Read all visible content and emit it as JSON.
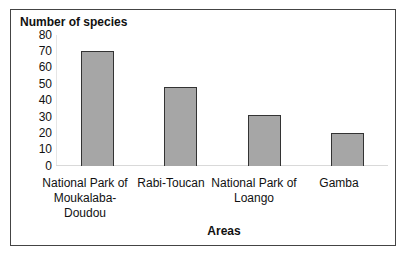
{
  "chart_data": {
    "type": "bar",
    "title": "",
    "ylabel": "Number of species",
    "xlabel": "Areas",
    "categories": [
      "National Park of Moukalaba-Doudou",
      "Rabi-Toucan",
      "National Park of Loango",
      "Gamba"
    ],
    "values": [
      70,
      48,
      31,
      20
    ],
    "ylim": [
      0,
      80
    ],
    "yticks": [
      0,
      10,
      20,
      30,
      40,
      50,
      60,
      70,
      80
    ],
    "grid": false,
    "legend": null,
    "bar_color": "#a6a6a6"
  },
  "labels": {
    "ytitle": "Number of species",
    "xtitle": "Areas",
    "cat0_l1": "National Park of",
    "cat0_l2": "Moukalaba-",
    "cat0_l3": "Doudou",
    "cat1_l1": "Rabi-Toucan",
    "cat2_l1": "National Park of",
    "cat2_l2": "Loango",
    "cat3_l1": "Gamba"
  },
  "ticks": [
    "80",
    "70",
    "60",
    "50",
    "40",
    "30",
    "20",
    "10",
    "0"
  ]
}
